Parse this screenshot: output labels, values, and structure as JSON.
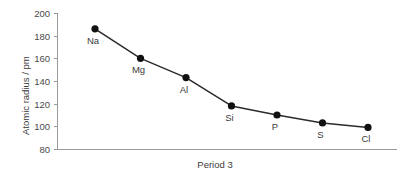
{
  "chart_data": {
    "type": "line",
    "title": "",
    "subtitle": "",
    "xlabel": "Period 3",
    "ylabel": "Atomic radius / pm",
    "categories": [
      "Na",
      "Mg",
      "Al",
      "Si",
      "P",
      "S",
      "Cl"
    ],
    "values": [
      186,
      160,
      143,
      118,
      110,
      103,
      99
    ],
    "point_labels": [
      "Na",
      "Mg",
      "Al",
      "Si",
      "P",
      "S",
      "Cl"
    ],
    "ylim": [
      80,
      200
    ],
    "ytick_labels": [
      "200",
      "180",
      "160",
      "140",
      "120",
      "100",
      "80"
    ],
    "ytick_values": [
      200,
      180,
      160,
      140,
      120,
      100,
      80
    ],
    "xtick_labels": [],
    "grid": false,
    "legend": false,
    "legend_position": "none",
    "marker": "circle",
    "colors": {
      "line": "#2b2b2b",
      "marker": "#111111",
      "axis": "#9a9a9a",
      "tick_text": "#4a4a4a",
      "label_text": "#3a3a3a",
      "background": "#ffffff"
    }
  },
  "axis": {
    "y_title": "Atomic radius / pm",
    "x_title": "Period 3"
  },
  "ticks": {
    "y": [
      {
        "label": "200"
      },
      {
        "label": "180"
      },
      {
        "label": "160"
      },
      {
        "label": "140"
      },
      {
        "label": "120"
      },
      {
        "label": "100"
      },
      {
        "label": "80"
      }
    ]
  },
  "points": [
    {
      "label": "Na",
      "value": 186
    },
    {
      "label": "Mg",
      "value": 160
    },
    {
      "label": "Al",
      "value": 143
    },
    {
      "label": "Si",
      "value": 118
    },
    {
      "label": "P",
      "value": 110
    },
    {
      "label": "S",
      "value": 103
    },
    {
      "label": "Cl",
      "value": 99
    }
  ]
}
